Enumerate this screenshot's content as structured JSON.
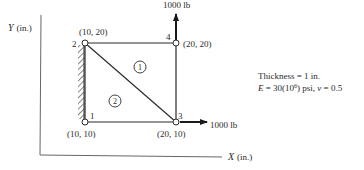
{
  "axes": {
    "y_label": "Y (in.)",
    "x_label": "X (in.)",
    "y_var": "Y",
    "x_var": "X",
    "unit": "(in.)"
  },
  "nodes": [
    {
      "id": "1",
      "coord": "(10, 10)"
    },
    {
      "id": "2",
      "coord": "(10, 20)"
    },
    {
      "id": "3",
      "coord": "(20, 10)"
    },
    {
      "id": "4",
      "coord": "(20, 20)"
    }
  ],
  "elements": [
    {
      "id": "1"
    },
    {
      "id": "2"
    }
  ],
  "loads": {
    "vertical": "1000 lb",
    "horizontal": "1000 lb"
  },
  "properties": {
    "thickness": "Thickness = 1 in.",
    "modulus_prefix": "E",
    "modulus_value": " = 30(10",
    "modulus_exp": "6",
    "modulus_suffix": ") psi, ",
    "poisson_symbol": "ν",
    "poisson_value": " = 0.5"
  },
  "colors": {
    "line": "#2b2b2b",
    "axis": "#555555",
    "background": "#ffffff"
  }
}
